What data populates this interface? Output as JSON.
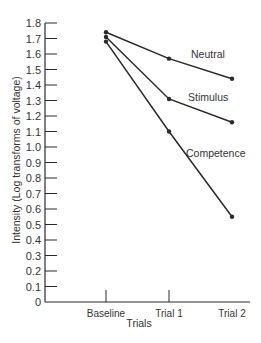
{
  "chart_data": {
    "type": "line",
    "title": "",
    "xlabel": "Trials",
    "ylabel": "Intensity (Log transforms of voltage)",
    "categories": [
      "Baseline",
      "Trial 1",
      "Trial 2"
    ],
    "ylim": [
      0,
      1.8
    ],
    "yticks": [
      "0",
      "0.1",
      "0.2",
      "0.3",
      "0.4",
      "0.5",
      "0.6",
      "0.7",
      "0.8",
      "0.9",
      "1.0",
      "1.1",
      "1.2",
      "1.3",
      "1.4",
      "1.5",
      "1.6",
      "1.7",
      "1.8"
    ],
    "grid": false,
    "legend": "inline labels",
    "series": [
      {
        "name": "Neutral",
        "values": [
          1.74,
          1.57,
          1.44
        ]
      },
      {
        "name": "Stimulus",
        "values": [
          1.71,
          1.31,
          1.16
        ]
      },
      {
        "name": "Competence",
        "values": [
          1.68,
          1.1,
          0.55
        ]
      }
    ],
    "line_color": "#2a2a2a"
  }
}
